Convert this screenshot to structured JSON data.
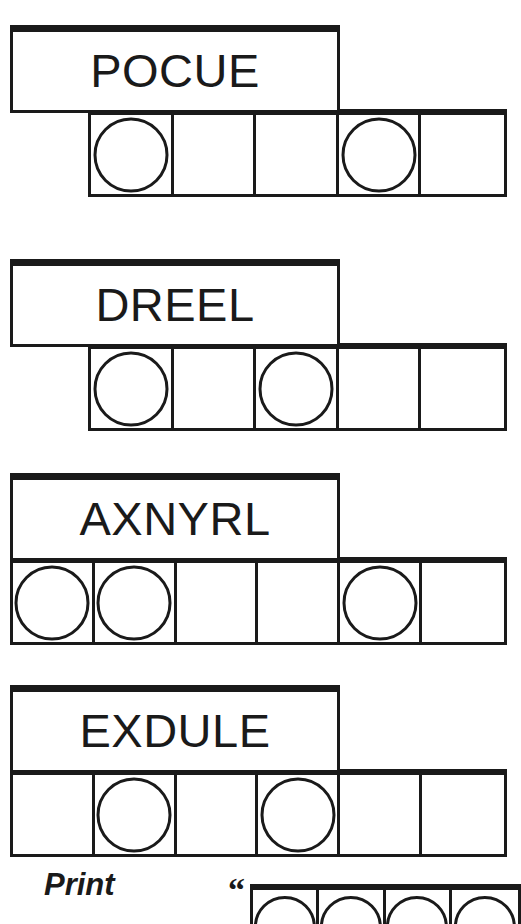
{
  "page": {
    "width": 521,
    "height": 905,
    "background": "#ffffff",
    "ink_color": "#1a1a1a",
    "kind": "word-puzzle-worksheet"
  },
  "puzzles": [
    {
      "word": "POCUE",
      "word_box": {
        "x": 10,
        "y": 25,
        "width": 330,
        "height": 88
      },
      "row": {
        "x": 88,
        "y": 109,
        "width": 419,
        "height": 88,
        "cells": 5
      },
      "circled_cells": [
        1,
        4
      ]
    },
    {
      "word": "DREEL",
      "word_box": {
        "x": 10,
        "y": 259,
        "width": 330,
        "height": 88
      },
      "row": {
        "x": 88,
        "y": 343,
        "width": 419,
        "height": 88,
        "cells": 5
      },
      "circled_cells": [
        1,
        3
      ]
    },
    {
      "word": "AXNYRL",
      "word_box": {
        "x": 10,
        "y": 473,
        "width": 330,
        "height": 88
      },
      "row": {
        "x": 10,
        "y": 557,
        "width": 497,
        "height": 88,
        "cells": 6
      },
      "circled_cells": [
        1,
        2,
        5
      ]
    },
    {
      "word": "EXDULE",
      "word_box": {
        "x": 10,
        "y": 685,
        "width": 330,
        "height": 88
      },
      "row": {
        "x": 10,
        "y": 769,
        "width": 497,
        "height": 88,
        "cells": 6
      },
      "circled_cells": [
        2,
        4
      ]
    }
  ],
  "footer": {
    "print_label": "Print",
    "print_label_pos": {
      "x": 44,
      "y": 869
    },
    "quote_mark": "“",
    "quote_mark_pos": {
      "x": 228,
      "y": 873
    },
    "row": {
      "x": 250,
      "y": 884,
      "width": 271,
      "height": 40,
      "cells": 4
    },
    "circled_cells": [
      1,
      2,
      3,
      4
    ]
  }
}
